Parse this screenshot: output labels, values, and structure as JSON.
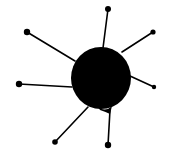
{
  "figure": {
    "ink_color": "#000000",
    "background_color": "#ffffff",
    "core": {
      "cx": 101,
      "cy": 78,
      "r": 30
    },
    "spokes": [
      {
        "name": "top",
        "x1": 103,
        "y1": 48,
        "x2": 108,
        "y2": 9,
        "dot_r": 3
      },
      {
        "name": "upper-right",
        "x1": 122,
        "y1": 52,
        "x2": 153,
        "y2": 32,
        "dot_r": 2.6
      },
      {
        "name": "right",
        "x1": 130,
        "y1": 76,
        "x2": 154,
        "y2": 87,
        "dot_r": 2.2
      },
      {
        "name": "bottom",
        "x1": 110,
        "y1": 110,
        "x2": 108,
        "y2": 145,
        "dot_r": 3.2
      },
      {
        "name": "lower-left",
        "x1": 88,
        "y1": 107,
        "x2": 55,
        "y2": 142,
        "dot_r": 2.8
      },
      {
        "name": "left",
        "x1": 72,
        "y1": 87,
        "x2": 19,
        "y2": 84,
        "dot_r": 3.2
      },
      {
        "name": "upper-left",
        "x1": 75,
        "y1": 61,
        "x2": 27,
        "y2": 32,
        "dot_r": 3.2
      }
    ]
  }
}
